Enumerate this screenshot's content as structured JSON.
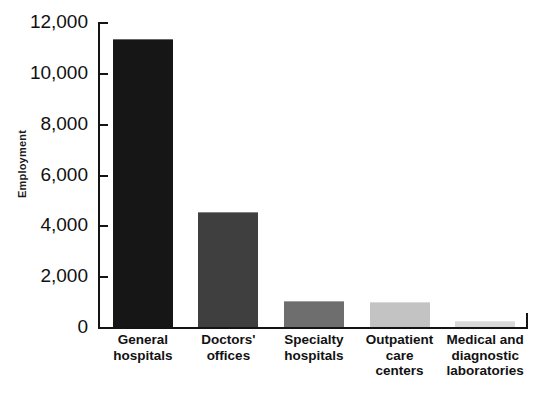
{
  "chart_data": {
    "type": "bar",
    "title": "",
    "subtitle": "",
    "xlabel": "",
    "ylabel": "Employment",
    "ylim": [
      0,
      12000
    ],
    "grid": false,
    "legend": false,
    "y_ticks": [
      {
        "value": 12000,
        "label": "12,000"
      },
      {
        "value": 10000,
        "label": "10,000"
      },
      {
        "value": 8000,
        "label": "8,000"
      },
      {
        "value": 6000,
        "label": "6,000"
      },
      {
        "value": 4000,
        "label": "4,000"
      },
      {
        "value": 2000,
        "label": "2,000"
      },
      {
        "value": 0,
        "label": "0"
      }
    ],
    "categories": [
      "General hospitals",
      "Doctors' offices",
      "Specialty hospitals",
      "Outpatient care centers",
      "Medical and diagnostic laboratories"
    ],
    "category_label_lines": [
      [
        "General",
        "hospitals"
      ],
      [
        "Doctors'",
        "offices"
      ],
      [
        "Specialty",
        "hospitals"
      ],
      [
        "Outpatient",
        "care",
        "centers"
      ],
      [
        "Medical and",
        "diagnostic",
        "laboratories"
      ]
    ],
    "values": [
      11300,
      4500,
      1000,
      950,
      200
    ],
    "bar_colors": [
      "#161616",
      "#3f3f3f",
      "#6e6e6e",
      "#c3c3c3",
      "#d8d8d8"
    ]
  },
  "axis": {
    "y_label_text": "Employment"
  }
}
